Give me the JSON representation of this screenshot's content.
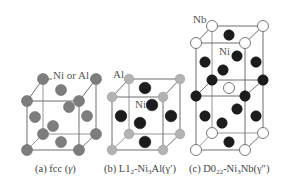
{
  "figure": {
    "panels": [
      {
        "id": "a",
        "caption_prefix": "(a) fcc (",
        "caption_phase": "γ",
        "caption_suffix": ")",
        "site_label": "Ni or Al",
        "atom_types": [
          "Ni or Al"
        ],
        "structure": "fcc"
      },
      {
        "id": "b",
        "caption_prefix": "(b) L1",
        "caption_sub": "2",
        "caption_mid": "-Ni",
        "caption_sub2": "3",
        "caption_suffix": "Al(γ′)",
        "corner_label": "Al",
        "face_label": "Ni",
        "structure": "L12"
      },
      {
        "id": "c",
        "caption_prefix": "(c) D0",
        "caption_sub": "22",
        "caption_mid": "-Ni",
        "caption_sub2": "3",
        "caption_suffix": "Nb(γ″)",
        "corner_label": "Nb",
        "face_label": "Ni",
        "structure": "D022"
      }
    ],
    "colors": {
      "mixed_atom": "#7d7d7d",
      "al_atom": "#b3b3b3",
      "ni_atom": "#1c1c1c",
      "nb_atom": "#ffffff",
      "edge": "#6f6f6f",
      "background": "#ffffff"
    }
  }
}
